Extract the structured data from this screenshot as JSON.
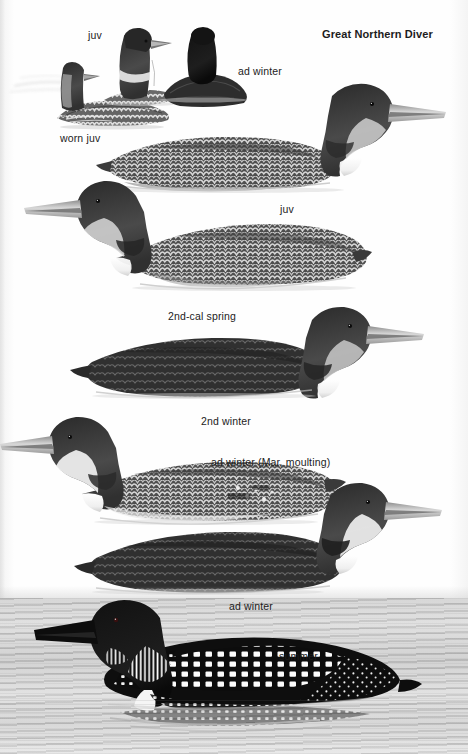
{
  "plate": {
    "title": "Great Northern Diver",
    "species": "Great Northern Diver",
    "medium": "field-guide illustration plate",
    "background_color": "#fdfdfd",
    "ink_color": "#1c1c1c",
    "water_color": "#c9c9c9"
  },
  "labels": [
    {
      "id": "juv-top",
      "text": "juv",
      "x": 88,
      "y": 30
    },
    {
      "id": "ad-winter-top",
      "text": "ad winter",
      "x": 238,
      "y": 66
    },
    {
      "id": "title",
      "text": "Great Northern Diver",
      "x": 322,
      "y": 29
    },
    {
      "id": "worn-juv",
      "text": "worn juv",
      "x": 60,
      "y": 133
    },
    {
      "id": "juv-mid",
      "text": "juv",
      "x": 280,
      "y": 204
    },
    {
      "id": "2nd-cal-spring",
      "text": "2nd-cal spring",
      "x": 168,
      "y": 311
    },
    {
      "id": "2nd-winter",
      "text": "2nd winter",
      "x": 201,
      "y": 416
    },
    {
      "id": "ad-winter-moulting",
      "text": "ad winter (Mar, moulting)",
      "x": 211,
      "y": 457
    },
    {
      "id": "ad-winter-lower",
      "text": "ad winter",
      "x": 229,
      "y": 601
    },
    {
      "id": "summer",
      "text": "summer",
      "x": 279,
      "y": 651
    }
  ],
  "figures": [
    {
      "id": "worn-juv-swimming",
      "plumage": "worn juv",
      "pose": "swimming, body low",
      "region": "top-left"
    },
    {
      "id": "juv-head-raised",
      "plumage": "juv",
      "pose": "head and neck raised",
      "region": "top-centre-left"
    },
    {
      "id": "ad-winter-head-on",
      "plumage": "ad winter",
      "pose": "head-on, rear view",
      "region": "top-centre"
    },
    {
      "id": "juv-swimming",
      "plumage": "juv",
      "pose": "swimming, side profile",
      "region": "upper"
    },
    {
      "id": "2nd-cal-spring-swimming",
      "plumage": "2nd-cal spring",
      "pose": "swimming, side profile",
      "region": "upper-middle"
    },
    {
      "id": "2nd-winter-swimming",
      "plumage": "2nd winter",
      "pose": "swimming, side profile",
      "region": "middle"
    },
    {
      "id": "ad-winter-moult-swimming",
      "plumage": "ad winter (Mar, moulting)",
      "pose": "swimming, side profile",
      "region": "lower-middle"
    },
    {
      "id": "ad-winter-swimming",
      "plumage": "ad winter",
      "pose": "swimming, side profile",
      "region": "lower"
    },
    {
      "id": "summer-swimming",
      "plumage": "summer",
      "pose": "swimming on open water",
      "region": "bottom"
    }
  ]
}
